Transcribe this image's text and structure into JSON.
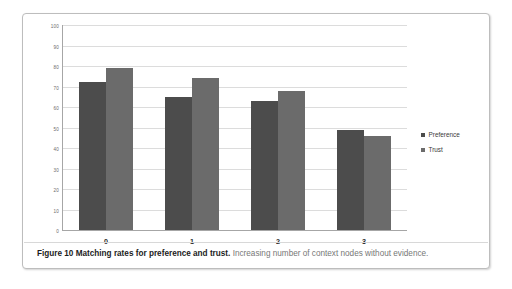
{
  "figure": {
    "caption_title": "Figure 10 Matching rates for preference and trust.",
    "caption_description": "Increasing number of context nodes without evidence."
  },
  "chart_data": {
    "type": "bar",
    "title": "",
    "xlabel": "",
    "ylabel": "",
    "categories": [
      "0",
      "1",
      "2",
      "3"
    ],
    "series": [
      {
        "name": "Preference",
        "color": "#4c4c4c",
        "values": [
          72,
          65,
          63,
          49
        ]
      },
      {
        "name": "Trust",
        "color": "#6b6b6b",
        "values": [
          79,
          74,
          68,
          46
        ]
      }
    ],
    "ylim": [
      0,
      100
    ],
    "ytick_labels": [
      "100",
      "90",
      "80",
      "70",
      "60",
      "50",
      "40",
      "30",
      "20",
      "10",
      "0"
    ],
    "ytick_values": [
      100,
      90,
      80,
      70,
      60,
      50,
      40,
      30,
      20,
      10,
      0
    ],
    "grid": true,
    "legend_position": "right",
    "annotations": []
  },
  "legend": {
    "items": [
      {
        "label": "Preference",
        "color": "#4c4c4c"
      },
      {
        "label": "Trust",
        "color": "#6b6b6b"
      }
    ]
  }
}
